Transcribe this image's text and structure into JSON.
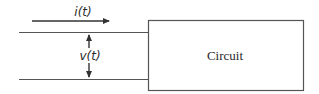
{
  "diagram": {
    "type": "circuit-port",
    "current_label": "i(t)",
    "voltage_label": "v(t)",
    "block_label": "Circuit",
    "colors": {
      "stroke": "#555555",
      "text": "#2a2a2a",
      "background": "#ffffff"
    }
  }
}
